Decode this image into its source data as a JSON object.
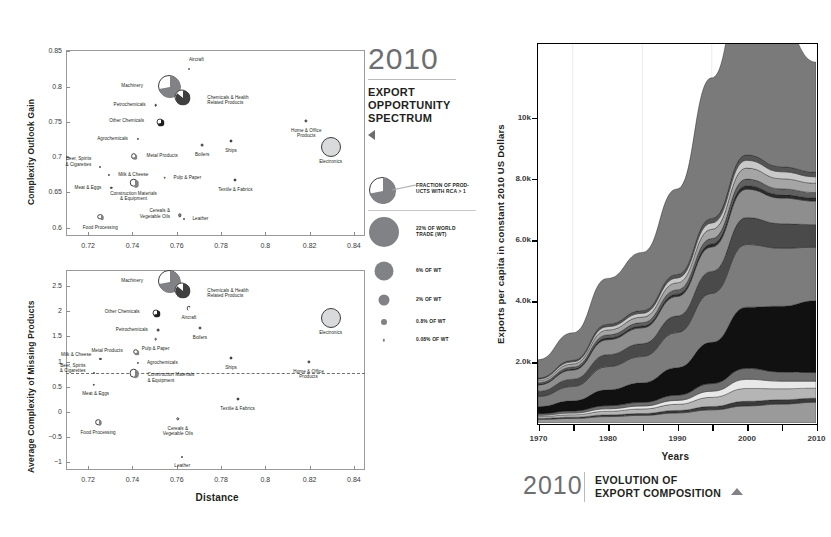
{
  "legend_panel": {
    "year": "2010",
    "title_lines": [
      "EXPORT",
      "OPPORTUNITY",
      "SPECTRUM"
    ],
    "triangle_icon": "triangle-left-icon",
    "pie_legend": {
      "label_lines": [
        "FRACTION OF PROD-",
        "UCTS WITH RCA > 1"
      ]
    },
    "size_legend": [
      {
        "label": "22% OF WORLD\nTRADE (WT)",
        "d": 30
      },
      {
        "label": "6% OF WT",
        "d": 19
      },
      {
        "label": "2% OF WT",
        "d": 11
      },
      {
        "label": "0.8% OF WT",
        "d": 6
      },
      {
        "label": "0.08% OF WT",
        "d": 2.4
      }
    ]
  },
  "caption": {
    "year": "2010",
    "lines": [
      "EVOLUTION OF",
      "EXPORT COMPOSITION"
    ],
    "triangle_icon": "triangle-up-icon"
  },
  "chart_data": [
    {
      "id": "complexity-outlook-gain",
      "type": "scatter",
      "title": "",
      "xlabel": "",
      "ylabel": "Complexity Outlook Gain",
      "xlim": [
        0.71,
        0.845
      ],
      "ylim": [
        0.588,
        0.852
      ],
      "xticks": [
        0.72,
        0.74,
        0.76,
        0.78,
        0.8,
        0.82,
        0.84
      ],
      "xticklabels": [
        "0.72",
        "0.74",
        "0.76",
        "0.78",
        "0.8",
        "0.82",
        "0.84"
      ],
      "yticks": [
        0.6,
        0.65,
        0.7,
        0.75,
        0.8,
        0.85
      ],
      "yticklabels": [
        "0.6",
        "0.65",
        "0.7",
        "0.75",
        "0.8",
        "0.85"
      ],
      "grid": false,
      "points": [
        {
          "name": "Aircraft",
          "x": 0.7655,
          "y": 0.8255,
          "size": 2.0,
          "fill": "#ffffff",
          "share": 0.8,
          "lx": 0,
          "ly": -12,
          "align": "lb"
        },
        {
          "name": "Machinery",
          "x": 0.7565,
          "y": 0.8005,
          "size": 22.0,
          "fill": "#808285",
          "share": 0.72,
          "lx": -26,
          "ly": -3,
          "align": "la"
        },
        {
          "name": "Chemicals & Health\nRelated Products",
          "x": 0.7625,
          "y": 0.7855,
          "size": 15.0,
          "fill": "#404041",
          "share": 0.86,
          "lx": 25,
          "ly": -2,
          "align": "lb"
        },
        {
          "name": "Petrochemicals",
          "x": 0.7505,
          "y": 0.7735,
          "size": 2.6,
          "fill": "#58595b",
          "share": 0.5,
          "lx": -10,
          "ly": -3,
          "align": "la"
        },
        {
          "name": "Other Chemicals",
          "x": 0.7525,
          "y": 0.7495,
          "size": 7.0,
          "fill": "#231f20",
          "share": 0.72,
          "lx": -16,
          "ly": -4,
          "align": "la"
        },
        {
          "name": "Agrochemicals",
          "x": 0.7425,
          "y": 0.7255,
          "size": 2.2,
          "fill": "#231f20",
          "share": 1.0,
          "lx": -10,
          "ly": -3,
          "align": "la"
        },
        {
          "name": "Metal Products",
          "x": 0.7405,
          "y": 0.7015,
          "size": 5.6,
          "fill": "#808285",
          "share": 0.7,
          "lx": 13,
          "ly": -3,
          "align": "lb"
        },
        {
          "name": "Beer, Spirits\n& Cigarettes",
          "x": 0.7255,
          "y": 0.6855,
          "size": 2.0,
          "fill": "#404041",
          "share": 0.55,
          "lx": -9,
          "ly": -11,
          "align": "la"
        },
        {
          "name": "Milk & Cheese",
          "x": 0.7295,
          "y": 0.6745,
          "size": 2.2,
          "fill": "#231f20",
          "share": 0.6,
          "lx": 9,
          "ly": -3,
          "align": "lb"
        },
        {
          "name": "Meat & Eggs",
          "x": 0.7305,
          "y": 0.6565,
          "size": 2.4,
          "fill": "#404041",
          "share": 0.55,
          "lx": -10,
          "ly": -3,
          "align": "la"
        },
        {
          "name": "Construction Materials\n& Equipment",
          "x": 0.7405,
          "y": 0.6635,
          "size": 8.6,
          "fill": "#808285",
          "share": 0.52,
          "lx": 0,
          "ly": 8,
          "align": "c"
        },
        {
          "name": "Pulp & Paper",
          "x": 0.7545,
          "y": 0.6705,
          "size": 2.6,
          "fill": "#ffffff",
          "share": 0.75,
          "lx": 9,
          "ly": -3,
          "align": "lb"
        },
        {
          "name": "Boilers",
          "x": 0.7715,
          "y": 0.7175,
          "size": 2.8,
          "fill": "#808285",
          "share": 0.6,
          "lx": 0,
          "ly": 7,
          "align": "c"
        },
        {
          "name": "Ships",
          "x": 0.7845,
          "y": 0.7235,
          "size": 3.0,
          "fill": "#231f20",
          "share": 1.0,
          "lx": 0,
          "ly": 7,
          "align": "c"
        },
        {
          "name": "Textile & Fabrics",
          "x": 0.7865,
          "y": 0.6675,
          "size": 3.0,
          "fill": "#231f20",
          "share": 1.0,
          "lx": 0,
          "ly": 7,
          "align": "c"
        },
        {
          "name": "Home & Office\nProducts",
          "x": 0.8185,
          "y": 0.7515,
          "size": 3.2,
          "fill": "#808285",
          "share": 0.7,
          "lx": 0,
          "ly": 7,
          "align": "c"
        },
        {
          "name": "Electronics",
          "x": 0.8295,
          "y": 0.7145,
          "size": 20.0,
          "fill": "#d9dadb",
          "share": 1.0,
          "lx": 0,
          "ly": 12,
          "align": "c"
        },
        {
          "name": "Food Processing",
          "x": 0.7255,
          "y": 0.6155,
          "size": 5.6,
          "fill": "#808285",
          "share": 0.52,
          "lx": 0,
          "ly": 8,
          "align": "c"
        },
        {
          "name": "Cereals &\nVegetable Oils",
          "x": 0.7615,
          "y": 0.6175,
          "size": 3.4,
          "fill": "#a7a9ac",
          "share": 0.62,
          "lx": -10,
          "ly": -7,
          "align": "la"
        },
        {
          "name": "Leather",
          "x": 0.7635,
          "y": 0.6125,
          "size": 2.0,
          "fill": "#231f20",
          "share": 1.0,
          "lx": 8,
          "ly": -3,
          "align": "lb"
        }
      ]
    },
    {
      "id": "average-complexity-of-missing-products",
      "type": "scatter",
      "title": "",
      "xlabel": "Distance",
      "ylabel": "Average Complexity of Missing Products",
      "xlim": [
        0.71,
        0.845
      ],
      "ylim": [
        -1.15,
        2.82
      ],
      "xticks": [
        0.72,
        0.74,
        0.76,
        0.78,
        0.8,
        0.82,
        0.84
      ],
      "xticklabels": [
        "0.72",
        "0.74",
        "0.76",
        "0.78",
        "0.8",
        "0.82",
        "0.84"
      ],
      "yticks": [
        -1,
        -0.5,
        0,
        0.5,
        1,
        1.5,
        2,
        2.5
      ],
      "yticklabels": [
        "−1",
        "−0.5",
        "0",
        "0.5",
        "1",
        "1.5",
        "2",
        "2.5"
      ],
      "grid": false,
      "reference_line": {
        "y": 0.78,
        "style": "dashed"
      },
      "points": [
        {
          "name": "Machinery",
          "x": 0.7565,
          "y": 2.6,
          "size": 22.0,
          "fill": "#808285",
          "share": 0.72,
          "lx": -26,
          "ly": -3,
          "align": "la"
        },
        {
          "name": "Chemicals & Health\nRelated Products",
          "x": 0.7625,
          "y": 2.43,
          "size": 15.0,
          "fill": "#404041",
          "share": 0.86,
          "lx": 25,
          "ly": -2,
          "align": "lb"
        },
        {
          "name": "Aircraft",
          "x": 0.7655,
          "y": 2.06,
          "size": 4.4,
          "fill": "#ffffff",
          "share": 0.8,
          "lx": 0,
          "ly": 7,
          "align": "c"
        },
        {
          "name": "Other Chemicals",
          "x": 0.7505,
          "y": 1.96,
          "size": 7.0,
          "fill": "#231f20",
          "share": 0.72,
          "lx": -16,
          "ly": -4,
          "align": "la"
        },
        {
          "name": "Petrochemicals",
          "x": 0.7515,
          "y": 1.62,
          "size": 2.8,
          "fill": "#58595b",
          "share": 0.5,
          "lx": -10,
          "ly": -3,
          "align": "la"
        },
        {
          "name": "Boilers",
          "x": 0.7705,
          "y": 1.66,
          "size": 3.0,
          "fill": "#808285",
          "share": 0.6,
          "lx": 0,
          "ly": 7,
          "align": "c"
        },
        {
          "name": "Pulp & Paper",
          "x": 0.7505,
          "y": 1.45,
          "size": 2.6,
          "fill": "#ffffff",
          "share": 0.75,
          "lx": 0,
          "ly": 7,
          "align": "c"
        },
        {
          "name": "Metal Products",
          "x": 0.7415,
          "y": 1.2,
          "size": 5.6,
          "fill": "#808285",
          "share": 0.7,
          "lx": -13,
          "ly": -4,
          "align": "la"
        },
        {
          "name": "Milk & Cheese",
          "x": 0.7255,
          "y": 1.06,
          "size": 2.2,
          "fill": "#231f20",
          "share": 0.6,
          "lx": -9,
          "ly": -7,
          "align": "la"
        },
        {
          "name": "Agrochemicals",
          "x": 0.7425,
          "y": 0.97,
          "size": 2.2,
          "fill": "#231f20",
          "share": 1.0,
          "lx": 9,
          "ly": -3,
          "align": "lb"
        },
        {
          "name": "Construction Materials\n& Equipment",
          "x": 0.7405,
          "y": 0.77,
          "size": 8.6,
          "fill": "#808285",
          "share": 0.52,
          "lx": 14,
          "ly": -1,
          "align": "lb"
        },
        {
          "name": "Beer, Spirits\n& Cigarettes",
          "x": 0.7225,
          "y": 0.78,
          "size": 2.0,
          "fill": "#404041",
          "share": 0.55,
          "lx": -8,
          "ly": -10,
          "align": "la"
        },
        {
          "name": "Meat & Eggs",
          "x": 0.7225,
          "y": 0.54,
          "size": 2.4,
          "fill": "#404041",
          "share": 0.55,
          "lx": 2,
          "ly": 6,
          "align": "c"
        },
        {
          "name": "Ships",
          "x": 0.7845,
          "y": 1.08,
          "size": 3.0,
          "fill": "#231f20",
          "share": 1.0,
          "lx": 0,
          "ly": 7,
          "align": "c"
        },
        {
          "name": "Home & Office\nProducts",
          "x": 0.8195,
          "y": 1.0,
          "size": 3.2,
          "fill": "#808285",
          "share": 0.7,
          "lx": 0,
          "ly": 7,
          "align": "c"
        },
        {
          "name": "Electronics",
          "x": 0.8295,
          "y": 1.87,
          "size": 20.0,
          "fill": "#d9dadb",
          "share": 1.0,
          "lx": 0,
          "ly": 12,
          "align": "c"
        },
        {
          "name": "Textile & Fabrics",
          "x": 0.7875,
          "y": 0.25,
          "size": 3.0,
          "fill": "#231f20",
          "share": 1.0,
          "lx": 0,
          "ly": 7,
          "align": "c"
        },
        {
          "name": "Food Processing",
          "x": 0.7245,
          "y": -0.2,
          "size": 5.6,
          "fill": "#808285",
          "share": 0.52,
          "lx": 0,
          "ly": 8,
          "align": "c"
        },
        {
          "name": "Cereals &\nVegetable Oils",
          "x": 0.7605,
          "y": -0.13,
          "size": 3.4,
          "fill": "#ffffff",
          "share": 0.62,
          "lx": 0,
          "ly": 7,
          "align": "c"
        },
        {
          "name": "Leather",
          "x": 0.7625,
          "y": -0.9,
          "size": 2.0,
          "fill": "#231f20",
          "share": 1.0,
          "lx": 0,
          "ly": 6,
          "align": "c"
        }
      ]
    },
    {
      "id": "evolution-of-export-composition",
      "type": "area",
      "stacked": true,
      "title": "",
      "xlabel": "Years",
      "ylabel": "Exports per capita in constant 2010 US Dollars",
      "xlim": [
        1970,
        2010
      ],
      "ylim": [
        0,
        12400
      ],
      "xticks": [
        1970,
        1975,
        1980,
        1985,
        1990,
        1995,
        2000,
        2005,
        2010
      ],
      "xticklabels": [
        "1970",
        "",
        "1980",
        "",
        "1990",
        "",
        "2000",
        "",
        "2010"
      ],
      "yticks": [
        2000,
        4000,
        6000,
        8000,
        10000
      ],
      "yticklabels": [
        "2.0k",
        "4.0k",
        "6.0k",
        "8.0k",
        "10k"
      ],
      "grid": true,
      "x": [
        1970,
        1975,
        1980,
        1985,
        1990,
        1995,
        2000,
        2005,
        2010
      ],
      "series": [
        {
          "name": "band-1",
          "color": "#9a9a9a",
          "values": [
            120,
            150,
            210,
            250,
            330,
            430,
            560,
            620,
            680
          ]
        },
        {
          "name": "band-2",
          "color": "#3a3a3a",
          "values": [
            30,
            40,
            55,
            60,
            80,
            110,
            150,
            140,
            130
          ]
        },
        {
          "name": "band-3",
          "color": "#b5b5b5",
          "values": [
            60,
            80,
            120,
            150,
            200,
            300,
            420,
            360,
            330
          ]
        },
        {
          "name": "band-4",
          "color": "#e8e8e8",
          "values": [
            40,
            55,
            80,
            95,
            130,
            200,
            300,
            250,
            230
          ]
        },
        {
          "name": "band-5",
          "color": "#6e6e6e",
          "values": [
            55,
            70,
            100,
            120,
            170,
            250,
            360,
            300,
            280
          ]
        },
        {
          "name": "band-6",
          "color": "#111111",
          "values": [
            230,
            330,
            520,
            640,
            900,
            1350,
            2000,
            2150,
            2350
          ]
        },
        {
          "name": "band-7",
          "color": "#7c7c7c",
          "values": [
            330,
            470,
            760,
            860,
            1150,
            1600,
            2050,
            1900,
            1750
          ]
        },
        {
          "name": "band-8",
          "color": "#4a4a4a",
          "values": [
            170,
            240,
            390,
            420,
            540,
            720,
            880,
            800,
            740
          ]
        },
        {
          "name": "band-9",
          "color": "#8e8e8e",
          "values": [
            210,
            300,
            490,
            520,
            640,
            800,
            930,
            840,
            770
          ]
        },
        {
          "name": "band-10",
          "color": "#2b2b2b",
          "values": [
            25,
            35,
            55,
            60,
            75,
            95,
            115,
            105,
            98
          ]
        },
        {
          "name": "band-11",
          "color": "#606060",
          "values": [
            45,
            62,
            100,
            110,
            140,
            180,
            215,
            195,
            180
          ]
        },
        {
          "name": "band-12",
          "color": "#a5a5a5",
          "values": [
            70,
            100,
            160,
            180,
            230,
            300,
            360,
            330,
            305
          ]
        },
        {
          "name": "band-13",
          "color": "#c9c9c9",
          "values": [
            50,
            70,
            112,
            125,
            160,
            210,
            255,
            230,
            212
          ]
        },
        {
          "name": "band-14",
          "color": "#545454",
          "values": [
            35,
            48,
            78,
            88,
            112,
            148,
            178,
            162,
            150
          ]
        },
        {
          "name": "band-15",
          "color": "#7a7a7a",
          "values": [
            600,
            900,
            1500,
            1900,
            2800,
            4600,
            6200,
            4600,
            3600
          ]
        }
      ]
    }
  ]
}
